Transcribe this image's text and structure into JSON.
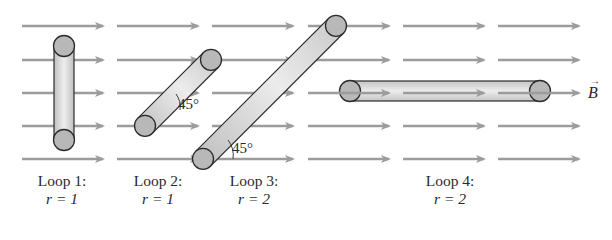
{
  "field": {
    "label": "B",
    "vector_mark": "→",
    "arrow_color": "#9c9c9c",
    "rows_y": [
      26,
      60,
      93,
      126,
      159
    ],
    "columns": [
      [
        22,
        103
      ],
      [
        117,
        198
      ],
      [
        212,
        293
      ],
      [
        308,
        389
      ],
      [
        403,
        484
      ],
      [
        498,
        579
      ]
    ]
  },
  "loops": [
    {
      "name": "Loop 1:",
      "r_label": "r = 1",
      "angle": ""
    },
    {
      "name": "Loop 2:",
      "r_label": "r = 1",
      "angle": "45°"
    },
    {
      "name": "Loop 3:",
      "r_label": "r = 2",
      "angle": "45°"
    },
    {
      "name": "Loop 4:",
      "r_label": "r = 2",
      "angle": ""
    }
  ],
  "colors": {
    "tube_fill": "#c8c8c8",
    "tube_highlight": "#ececec",
    "end_cap": "#b4b4b4",
    "outline": "#2b2b2b"
  }
}
